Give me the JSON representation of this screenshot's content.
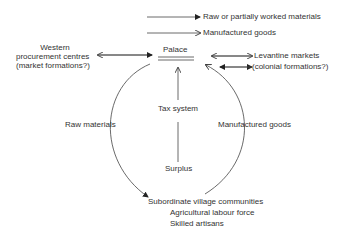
{
  "legend": {
    "raw": "Raw or partially worked materials",
    "manufactured": "Manufactured goods"
  },
  "nodes": {
    "palace": "Palace",
    "western_1": "Western",
    "western_2": "procurement centres",
    "western_3": "(market formations?)",
    "levantine_1": "Levantine markets",
    "levantine_2": "(colonial formations?)",
    "tax": "Tax system",
    "surplus": "Surplus",
    "raw_materials": "Raw materials",
    "manufactured_goods": "Manufactured goods",
    "village_1": "Subordinate village communities",
    "village_2": "Agricultural labour force",
    "village_3": "Skilled artisans"
  },
  "colors": {
    "line": "#444444",
    "text": "#333333"
  }
}
